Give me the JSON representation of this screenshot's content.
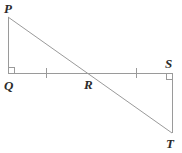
{
  "figure": {
    "stroke_color": "#9a9a9a",
    "label_color": "#2b2b2b",
    "background_color": "#ffffff",
    "width": 182,
    "height": 153
  },
  "labels": {
    "P": "P",
    "Q": "Q",
    "R": "R",
    "S": "S",
    "T": "T"
  },
  "points": {
    "P": {
      "x": 8,
      "y": 17
    },
    "Q": {
      "x": 8,
      "y": 73
    },
    "R": {
      "x": 91,
      "y": 73
    },
    "S": {
      "x": 172,
      "y": 73
    },
    "T": {
      "x": 172,
      "y": 133
    }
  },
  "segments": [
    {
      "name": "PQ",
      "from": "P",
      "to": "Q"
    },
    {
      "name": "QS",
      "from": "Q",
      "to": "S"
    },
    {
      "name": "PT",
      "from": "P",
      "to": "T"
    },
    {
      "name": "ST",
      "from": "S",
      "to": "T"
    }
  ],
  "right_angles": [
    {
      "name": "right-angle-Q",
      "vertex": "Q",
      "x": 8,
      "y": 73,
      "dx": 1,
      "dy": -1,
      "size": 6
    },
    {
      "name": "right-angle-S",
      "vertex": "S",
      "x": 172,
      "y": 73,
      "dx": -1,
      "dy": 1,
      "size": 6
    }
  ],
  "tick_marks": [
    {
      "name": "tick-QR",
      "segment": "QR",
      "x": 46,
      "y": 73,
      "half_height": 5
    },
    {
      "name": "tick-RS",
      "segment": "RS",
      "x": 136,
      "y": 73,
      "half_height": 5
    }
  ]
}
